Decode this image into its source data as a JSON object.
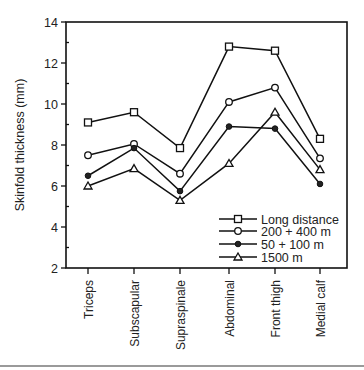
{
  "chart_data": {
    "type": "line",
    "title": "",
    "xlabel": "",
    "ylabel": "Skinfold thickness (mm)",
    "ylim": [
      2,
      14
    ],
    "yticks": [
      2,
      4,
      6,
      8,
      10,
      12,
      14
    ],
    "grid": false,
    "legend_position": "lower right (inside)",
    "categories": [
      "Triceps",
      "Subscapular",
      "Supraspinale",
      "Abdominal",
      "Front thigh",
      "Medial calf"
    ],
    "series": [
      {
        "name": "Long distance",
        "marker": "open-square",
        "values": [
          9.1,
          9.6,
          7.85,
          12.8,
          12.6,
          8.3
        ]
      },
      {
        "name": "200 + 400 m",
        "marker": "open-circle",
        "values": [
          7.5,
          8.05,
          6.6,
          10.1,
          10.8,
          7.35
        ]
      },
      {
        "name": "50 + 100 m",
        "marker": "filled-circle",
        "values": [
          6.5,
          7.85,
          5.75,
          8.9,
          8.8,
          6.1
        ]
      },
      {
        "name": "1500 m",
        "marker": "triangle",
        "values": [
          6.0,
          6.85,
          5.3,
          7.1,
          9.6,
          6.8
        ]
      }
    ]
  }
}
